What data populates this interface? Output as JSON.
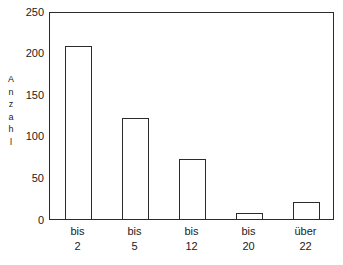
{
  "chart_data": {
    "type": "bar",
    "title": "",
    "subtitle": "",
    "xlabel": "",
    "ylabel": "Anzahl",
    "categories": [
      "bis 2",
      "bis 5",
      "bis 12",
      "bis 20",
      "über 22"
    ],
    "category_lines": [
      [
        "bis",
        "2"
      ],
      [
        "bis",
        "5"
      ],
      [
        "bis",
        "12"
      ],
      [
        "bis",
        "20"
      ],
      [
        "über",
        "22"
      ]
    ],
    "values": [
      208,
      121,
      72,
      7,
      20
    ],
    "ylim": [
      0,
      250
    ],
    "yticks": [
      0,
      50,
      100,
      150,
      200,
      250
    ],
    "ytick_labels": [
      "0",
      "50",
      "100",
      "150",
      "200",
      "250"
    ],
    "grid": false,
    "legend": false,
    "legend_position": "none",
    "bar_fill_color": "#ffffff",
    "bar_edge_color": "#2b2b2b",
    "axis_color": "#2b2b2b",
    "background_color": "#ffffff"
  },
  "axis_caption_letters": [
    "A",
    "n",
    "z",
    "a",
    "h",
    "l"
  ]
}
